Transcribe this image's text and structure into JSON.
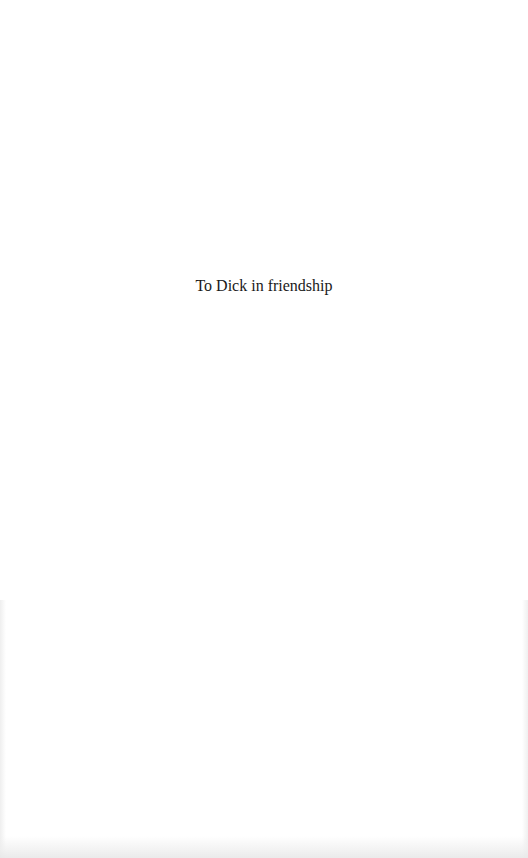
{
  "page": {
    "dedication": "To Dick in friendship"
  },
  "colors": {
    "background": "#ffffff",
    "text": "#1a1a1a"
  }
}
